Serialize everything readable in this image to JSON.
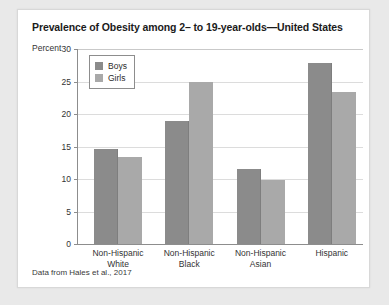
{
  "card": {
    "title": "Prevalence of Obesity among 2– to 19-year-olds—United States",
    "source_note": "Data from Hales et al., 2017"
  },
  "legend": {
    "entries": [
      {
        "label": "Boys",
        "color": "#8b8b8b",
        "swatch_name": "legend-swatch-boys"
      },
      {
        "label": "Girls",
        "color": "#a9a9a9",
        "swatch_name": "legend-swatch-girls"
      }
    ]
  },
  "chart_data": {
    "type": "bar",
    "title": "Prevalence of Obesity among 2– to 19-year-olds—United States",
    "subtitle": "",
    "xlabel": "",
    "ylabel": "Percent",
    "ylim": [
      0,
      30
    ],
    "yticks": [
      0,
      5,
      10,
      15,
      20,
      25,
      30
    ],
    "ytick_labels": [
      "0",
      "5",
      "10",
      "15",
      "20",
      "25",
      "30"
    ],
    "grid": "horizontal",
    "legend_position": "top-left-inside",
    "categories": [
      "Non-Hispanic White",
      "Non-Hispanic Black",
      "Non-Hispanic Asian",
      "Hispanic"
    ],
    "category_lines": [
      [
        "Non-Hispanic",
        "White"
      ],
      [
        "Non-Hispanic",
        "Black"
      ],
      [
        "Non-Hispanic",
        "Asian"
      ],
      [
        "Hispanic",
        ""
      ]
    ],
    "series": [
      {
        "name": "Boys",
        "color": "#8b8b8b",
        "values": [
          14.6,
          18.9,
          11.5,
          27.9
        ]
      },
      {
        "name": "Girls",
        "color": "#a9a9a9",
        "values": [
          13.4,
          25.0,
          9.8,
          23.4
        ]
      }
    ],
    "source": "Data from Hales et al., 2017"
  }
}
